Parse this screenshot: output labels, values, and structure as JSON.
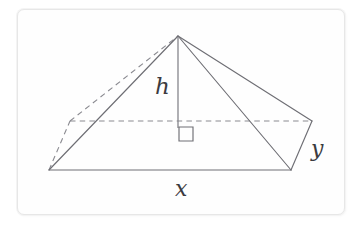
{
  "figure": {
    "kind": "geometry-diagram",
    "background_color": "#ffffff",
    "card": {
      "background_color": "#fefefe",
      "border_color": "#e7e7e7",
      "corner_radius_px": 7
    },
    "stroke": {
      "solid_color": "#6e6e74",
      "dashed_color": "#8a8a90",
      "height_color": "#85858b",
      "solid_width_px": 1.15,
      "dash_pattern": "5.5 4.2"
    },
    "labels": {
      "height": "h",
      "base_length": "x",
      "base_width": "y"
    },
    "label_color": "#3b3b40",
    "vertices": {
      "apex": [
        178,
        36
      ],
      "front_left": [
        49,
        170
      ],
      "front_right": [
        291,
        170
      ],
      "back_left": [
        70,
        121
      ],
      "back_right": [
        312,
        121
      ],
      "base_center": [
        178,
        121
      ]
    },
    "edges": [
      {
        "name": "base-front",
        "from": "front_left",
        "to": "front_right",
        "style": "solid"
      },
      {
        "name": "base-right",
        "from": "front_right",
        "to": "back_right",
        "style": "solid"
      },
      {
        "name": "base-back",
        "from": "back_left",
        "to": "back_right",
        "style": "dashed"
      },
      {
        "name": "base-left",
        "from": "front_left",
        "to": "back_left",
        "style": "dashed"
      },
      {
        "name": "lateral-front-left",
        "from": "front_left",
        "to": "apex",
        "style": "solid"
      },
      {
        "name": "lateral-front-right",
        "from": "front_right",
        "to": "apex",
        "style": "solid"
      },
      {
        "name": "lateral-back-right",
        "from": "back_right",
        "to": "apex",
        "style": "solid"
      },
      {
        "name": "lateral-back-left",
        "from": "back_left",
        "to": "apex",
        "style": "dashed"
      },
      {
        "name": "height-segment",
        "from": "apex",
        "to": "base_center",
        "style": "solid"
      }
    ],
    "right_angle_marker": {
      "name": "right-angle-square",
      "x": 179,
      "y": 127,
      "size_px": 14
    }
  }
}
